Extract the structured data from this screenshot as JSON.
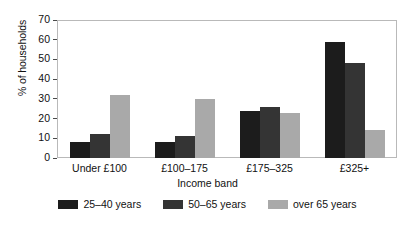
{
  "chart_data": {
    "type": "bar",
    "title": "",
    "xlabel": "Income band",
    "ylabel": "% of households",
    "categories": [
      "Under £100",
      "£100–175",
      "£175–325",
      "£325+"
    ],
    "series": [
      {
        "name": "25–40 years",
        "color": "#1c1c1c",
        "values": [
          8,
          8,
          24,
          59
        ]
      },
      {
        "name": "50–65 years",
        "color": "#343434",
        "values": [
          12,
          11,
          26,
          48
        ]
      },
      {
        "name": "over 65 years",
        "color": "#a9a9a9",
        "values": [
          32,
          30,
          23,
          14
        ]
      }
    ],
    "ylim": [
      0,
      70
    ],
    "yticks": [
      0,
      10,
      20,
      30,
      40,
      50,
      60,
      70
    ],
    "ytick_labels": [
      "0",
      "10",
      "20",
      "30",
      "40",
      "50",
      "60",
      "70"
    ],
    "grid": false,
    "legend_position": "bottom",
    "frame_color": "#b9b9b9",
    "background": "#ffffff"
  }
}
